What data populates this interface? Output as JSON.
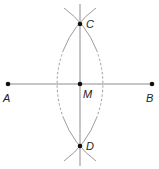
{
  "diagram": {
    "points": [
      {
        "id": "A",
        "label": "A",
        "x": 8,
        "y": 84
      },
      {
        "id": "B",
        "label": "B",
        "x": 152,
        "y": 84
      },
      {
        "id": "M",
        "label": "M",
        "x": 80,
        "y": 84
      },
      {
        "id": "C",
        "label": "C",
        "x": 80,
        "y": 24
      },
      {
        "id": "D",
        "label": "D",
        "x": 80,
        "y": 146
      }
    ],
    "segments": [
      {
        "from": "A",
        "to": "B",
        "style": "solid"
      },
      {
        "from": "C",
        "to": "D",
        "style": "solid",
        "extended": true
      }
    ],
    "arcs": [
      {
        "center": "A",
        "radius": 93.7,
        "through": [
          "C",
          "D"
        ],
        "style": "solid-ends-dashed-middle"
      },
      {
        "center": "B",
        "radius": 93.7,
        "through": [
          "C",
          "D"
        ],
        "style": "solid-ends-dashed-middle"
      }
    ],
    "labels": {
      "A": "A",
      "B": "B",
      "M": "M",
      "C": "C",
      "D": "D"
    },
    "colors": {
      "line": "#8c8c8c",
      "arc": "#9a9a9a",
      "point": "#111111",
      "label": "#222222",
      "background": "#ffffff"
    }
  }
}
